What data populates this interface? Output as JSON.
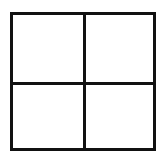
{
  "diagram": {
    "type": "2x2 grid",
    "rows": 2,
    "columns": 2,
    "line_color": "#111111",
    "background_color": "#ffffff",
    "cells": [
      {
        "position": "top-left",
        "label": ""
      },
      {
        "position": "top-right",
        "label": ""
      },
      {
        "position": "bottom-left",
        "label": ""
      },
      {
        "position": "bottom-right",
        "label": ""
      }
    ]
  }
}
